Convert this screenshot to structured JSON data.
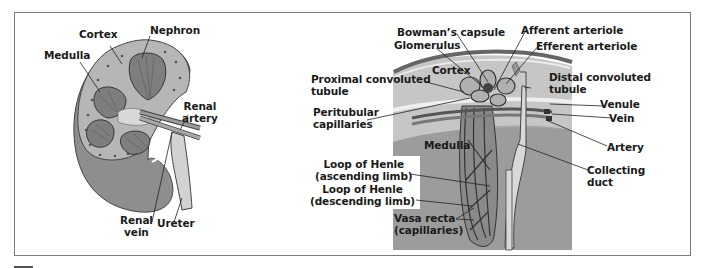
{
  "figure": {
    "left_panel": {
      "title": "Kidney cross-section",
      "labels": {
        "cortex": "Cortex",
        "nephron": "Nephron",
        "medulla": "Medulla",
        "renal_artery_1": "Renal",
        "renal_artery_2": "artery",
        "renal_vein_1": "Renal",
        "renal_vein_2": "vein",
        "ureter": "Ureter"
      }
    },
    "right_panel": {
      "title": "Nephron structure",
      "labels": {
        "bowmans_capsule": "Bowman’s capsule",
        "glomerulus": "Glomerulus",
        "afferent_arteriole": "Afferent arteriole",
        "efferent_arteriole": "Efferent arteriole",
        "cortex": "Cortex",
        "proximal_1": "Proximal convoluted",
        "proximal_2": "tubule",
        "distal_1": "Distal convoluted",
        "distal_2": "tubule",
        "peritubular_1": "Peritubular",
        "peritubular_2": "capillaries",
        "venule": "Venule",
        "vein": "Vein",
        "artery": "Artery",
        "medulla": "Medulla",
        "collecting_1": "Collecting",
        "collecting_2": "duct",
        "loop_asc_1": "Loop of Henle",
        "loop_asc_2": "(ascending limb)",
        "loop_desc_1": "Loop of Henle",
        "loop_desc_2": "(descending limb)",
        "vasa_1": "Vasa recta",
        "vasa_2": "(capillaries)"
      }
    },
    "colors": {
      "frame": "#7a7a7a",
      "kidney_outer": "#8c8c8c",
      "cortex": "#b4b4b4",
      "medulla_bg": "#9a9a9a",
      "cortex_bg": "#c8c8c8",
      "capsule": "#6e6e6e"
    }
  }
}
